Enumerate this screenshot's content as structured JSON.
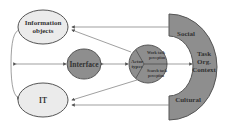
{
  "diagram": {
    "nodes": {
      "information_objects": {
        "line1": "Information",
        "line2": "objects"
      },
      "interface": {
        "label": "Interface"
      },
      "it": {
        "label": "IT"
      },
      "actor": {
        "center_line1": "Actor",
        "center_line2": "types",
        "top_line1": "Work task",
        "top_line2": "perception",
        "bottom_line1": "Search task",
        "bottom_line2": "perception"
      },
      "context": {
        "top": "Social",
        "middle_line1": "Task",
        "middle_line2": "Org.",
        "middle_line3": "Context",
        "bottom": "Cultural"
      }
    },
    "colors": {
      "light_fill": "#ebebeb",
      "dark_fill": "#8e8e8e",
      "stroke": "#555555",
      "text": "#333333"
    }
  }
}
